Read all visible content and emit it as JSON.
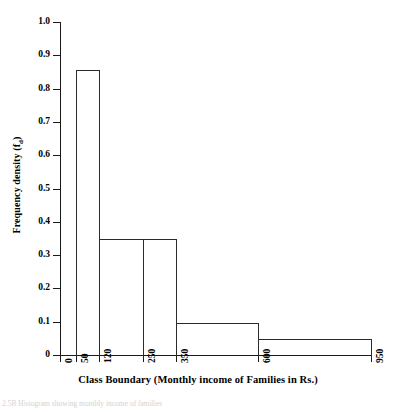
{
  "figure": {
    "caption_partial": "2.5B  Histogram  showing  monthly  income  of  families"
  },
  "axes": {
    "y_title_main": "Frequency density (f",
    "y_title_sub": "d",
    "y_title_close": ")",
    "x_title": "Class Boundary (Monthly income of Families in Rs.)"
  },
  "chart_data": {
    "type": "bar",
    "title": "",
    "subtitle": "",
    "xlabel": "Class Boundary (Monthly income of Families in Rs.)",
    "ylabel": "Frequency density (fd)",
    "grid": false,
    "legend": "none",
    "ylim": [
      0,
      1.0
    ],
    "yticks": [
      0,
      0.1,
      0.2,
      0.3,
      0.4,
      0.5,
      0.6,
      0.7,
      0.8,
      0.9,
      1.0
    ],
    "ytick_labels": [
      "0",
      "0.1",
      "0.2",
      "0.3",
      "0.4",
      "0.5",
      "0.6",
      "0.7",
      "0.8",
      "0.9",
      "1.0"
    ],
    "xticks": [
      0,
      50,
      120,
      250,
      350,
      600,
      950
    ],
    "xtick_labels": [
      "0",
      "50",
      "120",
      "250",
      "350",
      "600",
      "950"
    ],
    "xtick_positions_px": [
      0,
      16,
      39,
      83,
      116,
      198,
      311
    ],
    "categories": [
      "50-120",
      "120-250",
      "250-350",
      "350-600",
      "600-950"
    ],
    "values": [
      0.86,
      0.35,
      0.35,
      0.1,
      0.05
    ],
    "bars": [
      {
        "class_interval": "50 - 120",
        "lower": 50,
        "upper": 120,
        "frequency_density": 0.86,
        "x0_px": 16,
        "x1_px": 39
      },
      {
        "class_interval": "120 - 250",
        "lower": 120,
        "upper": 250,
        "frequency_density": 0.35,
        "x0_px": 39,
        "x1_px": 83
      },
      {
        "class_interval": "250 - 350",
        "lower": 250,
        "upper": 350,
        "frequency_density": 0.35,
        "x0_px": 83,
        "x1_px": 116
      },
      {
        "class_interval": "350 - 600",
        "lower": 350,
        "upper": 600,
        "frequency_density": 0.1,
        "x0_px": 116,
        "x1_px": 198
      },
      {
        "class_interval": "600 - 950",
        "lower": 600,
        "upper": 950,
        "frequency_density": 0.05,
        "x0_px": 198,
        "x1_px": 311
      }
    ]
  },
  "colors": {
    "bar_outline": "#2b2b2b",
    "axis": "#1a1a1a",
    "background": "#ffffff",
    "text": "#000000"
  }
}
